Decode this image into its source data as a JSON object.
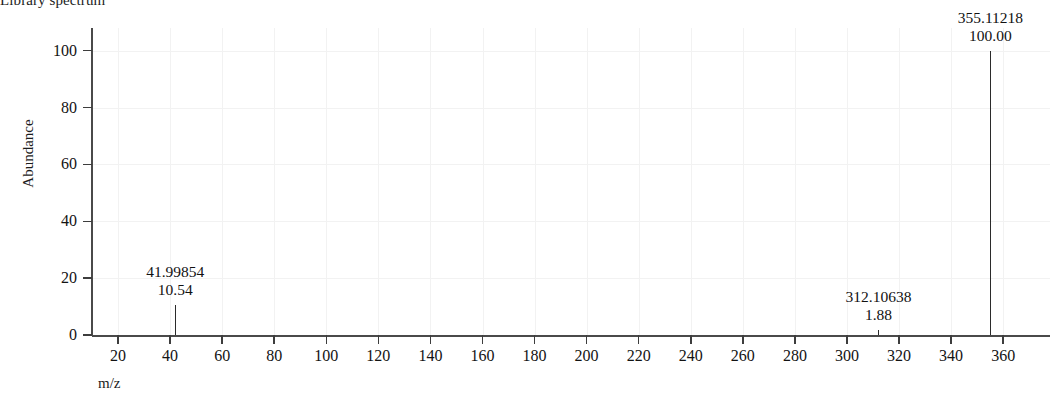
{
  "chart_data": {
    "type": "bar",
    "title": "Library spectrum",
    "subtitle": "",
    "xlabel": "m/z",
    "ylabel": "Abundance",
    "xlim": [
      10,
      378
    ],
    "ylim": [
      0,
      108
    ],
    "grid": true,
    "legend": null,
    "x_ticks": [
      20,
      40,
      60,
      80,
      100,
      120,
      140,
      160,
      180,
      200,
      220,
      240,
      260,
      280,
      300,
      320,
      340,
      360
    ],
    "y_ticks": [
      0,
      20,
      40,
      60,
      80,
      100
    ],
    "x": [
      41.99854,
      312.10638,
      355.11218
    ],
    "values": [
      10.54,
      1.88,
      100.0
    ],
    "annotations": [
      {
        "mz": "41.99854",
        "abundance": "10.54"
      },
      {
        "mz": "312.10638",
        "abundance": "1.88"
      },
      {
        "mz": "355.11218",
        "abundance": "100.00"
      }
    ],
    "colors": {
      "peak": "#2b2b2b",
      "axis": "#4a4a4a",
      "grid": "#f2f2f2",
      "text": "#131313",
      "background": "#ffffff"
    }
  }
}
